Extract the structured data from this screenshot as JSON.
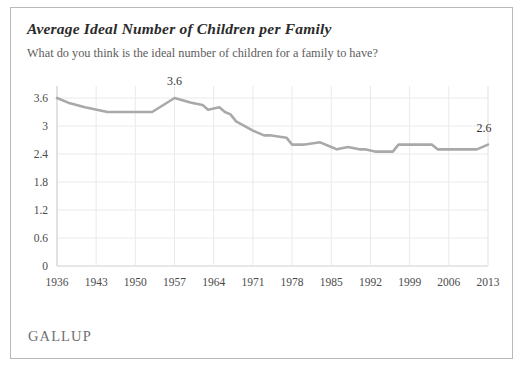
{
  "card": {
    "title": "Average Ideal Number of Children per Family",
    "subtitle": "What do you think is the ideal number of children for a family to have?",
    "source_logo": "GALLUP"
  },
  "colors": {
    "line": "#a9a9a9",
    "grid": "#eaeaea",
    "axis": "#cfcfcf",
    "border": "#b9b9b9",
    "title_text": "#2b2b2b",
    "subtitle_text": "#5d5d5d",
    "tick_text": "#4a4a4a",
    "logo_text": "#6f6f6f"
  },
  "annotations": [
    {
      "name": "peak-label",
      "text": "3.6",
      "x": 1957,
      "y": 3.6
    },
    {
      "name": "end-label",
      "text": "2.6",
      "x": 2013,
      "y": 2.6
    }
  ],
  "chart_data": {
    "type": "line",
    "title": "Average Ideal Number of Children per Family",
    "subtitle": "What do you think is the ideal number of children for a family to have?",
    "xlabel": "",
    "ylabel": "",
    "xlim": [
      1936,
      2013
    ],
    "ylim": [
      0,
      3.6
    ],
    "grid": true,
    "legend": false,
    "y_ticks": [
      0,
      0.6,
      1.2,
      1.8,
      2.4,
      3,
      3.6
    ],
    "y_tick_labels": [
      "0",
      "0.6",
      "1.2",
      "1.8",
      "2.4",
      "3",
      "3.6"
    ],
    "x_ticks": [
      1936,
      1943,
      1950,
      1957,
      1964,
      1971,
      1978,
      1985,
      1992,
      1999,
      2006,
      2013
    ],
    "x_tick_labels": [
      "1936",
      "1943",
      "1950",
      "1957",
      "1964",
      "1971",
      "1978",
      "1985",
      "1992",
      "1999",
      "2006",
      "2013"
    ],
    "series": [
      {
        "name": "Average ideal number of children",
        "color": "#a9a9a9",
        "x": [
          1936,
          1938,
          1941,
          1945,
          1947,
          1953,
          1957,
          1960,
          1962,
          1963,
          1965,
          1966,
          1967,
          1968,
          1971,
          1973,
          1974,
          1977,
          1978,
          1980,
          1983,
          1985,
          1986,
          1988,
          1990,
          1991,
          1993,
          1996,
          1997,
          2003,
          2004,
          2007,
          2011,
          2013
        ],
        "y": [
          3.6,
          3.5,
          3.4,
          3.3,
          3.3,
          3.3,
          3.6,
          3.5,
          3.45,
          3.35,
          3.4,
          3.3,
          3.25,
          3.1,
          2.9,
          2.8,
          2.8,
          2.75,
          2.6,
          2.6,
          2.65,
          2.55,
          2.5,
          2.55,
          2.5,
          2.5,
          2.45,
          2.45,
          2.6,
          2.6,
          2.5,
          2.5,
          2.5,
          2.6
        ]
      }
    ]
  }
}
